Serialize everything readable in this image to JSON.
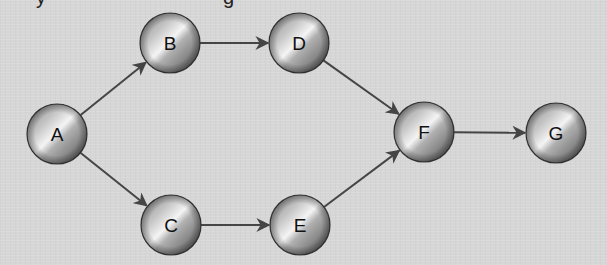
{
  "caption_fragment": {
    "glyphs": [
      {
        "char": "y",
        "x": 36
      },
      {
        "char": "g",
        "x": 223
      }
    ]
  },
  "colors": {
    "background": "#d6d6d6",
    "edge": "#454545",
    "node_light": "#f2f2f2",
    "node_mid": "#9a9a9a",
    "node_dark": "#5a5a5a",
    "node_outline": "#3a3a3a",
    "label": "#111111"
  },
  "diagram": {
    "type": "directed-graph",
    "node_radius": 30,
    "nodes": [
      {
        "id": "A",
        "label": "A",
        "x": 57,
        "y": 134
      },
      {
        "id": "B",
        "label": "B",
        "x": 170,
        "y": 43
      },
      {
        "id": "C",
        "label": "C",
        "x": 171,
        "y": 225
      },
      {
        "id": "D",
        "label": "D",
        "x": 299,
        "y": 43
      },
      {
        "id": "E",
        "label": "E",
        "x": 300,
        "y": 225
      },
      {
        "id": "F",
        "label": "F",
        "x": 424,
        "y": 132
      },
      {
        "id": "G",
        "label": "G",
        "x": 556,
        "y": 133
      }
    ],
    "edges": [
      {
        "from": "A",
        "to": "B"
      },
      {
        "from": "A",
        "to": "C"
      },
      {
        "from": "B",
        "to": "D"
      },
      {
        "from": "C",
        "to": "E"
      },
      {
        "from": "D",
        "to": "F"
      },
      {
        "from": "E",
        "to": "F"
      },
      {
        "from": "F",
        "to": "G"
      }
    ]
  }
}
